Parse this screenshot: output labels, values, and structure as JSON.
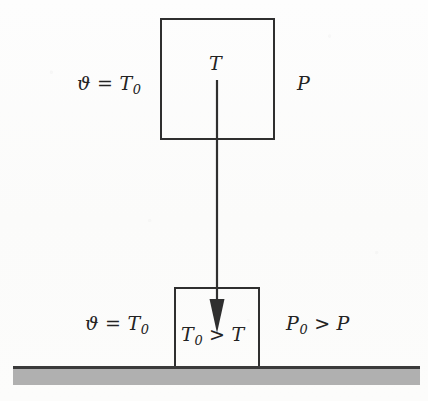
{
  "figure": {
    "name": "thermodynamic-gas-expansion-diagram",
    "background_color": "#fcfcfc",
    "stroke_color": "#2f2f2f",
    "ground_color": "#b0b0b0",
    "ground_line_color": "#3a3a3a"
  },
  "upper_system": {
    "left_label": "ϑ = T",
    "left_label_sub": "0",
    "inner_label": "T",
    "right_label": "P"
  },
  "lower_system": {
    "left_label": "ϑ = T",
    "left_label_sub": "0",
    "inner_label_lhs": "T",
    "inner_label_lhs_sub": "0",
    "inner_label_op": " > ",
    "inner_label_rhs": "T",
    "right_label_lhs": "P",
    "right_label_lhs_sub": "0",
    "right_label_op": " > ",
    "right_label_rhs": "P"
  },
  "arrow": {
    "name": "downward-process-arrow",
    "direction": "down",
    "x": 217,
    "y_start": 80,
    "y_end": 332
  }
}
